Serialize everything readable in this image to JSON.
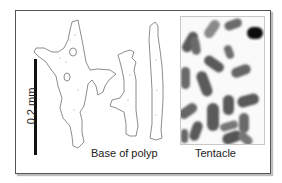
{
  "figure": {
    "scale_bar": {
      "label": "0.2 mm"
    },
    "panels": [
      {
        "id": "base",
        "caption": "Base of polyp",
        "type": "drawing",
        "sclerite_count": 3
      },
      {
        "id": "tentacle",
        "caption": "Tentacle",
        "type": "micrograph"
      }
    ],
    "colors": {
      "frame": "#555555",
      "outline": "#666666",
      "sclerite_dark": "#4a4a4a",
      "scale_bar": "#111111"
    }
  }
}
